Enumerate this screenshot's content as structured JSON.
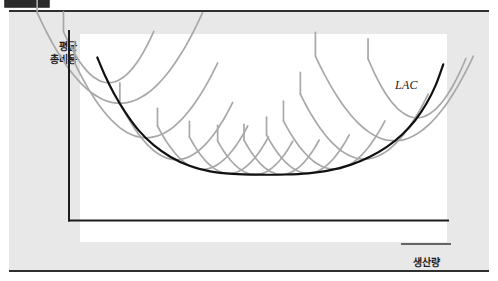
{
  "figure": {
    "kind": "economics-diagram",
    "background_color": "#e8e8e8",
    "plot_background_color": "#ffffff",
    "corner_tab_color": "#2b2b2b"
  },
  "axes": {
    "y_label_line1": "평균",
    "y_label_line2": "총비용",
    "x_label": "생산량",
    "axis_color": "#1c1c1c"
  },
  "annotations": {
    "lac_label": "LAC"
  },
  "chart_data": {
    "type": "line",
    "title": "",
    "subtitle": "",
    "xlabel": "생산량",
    "ylabel": "평균 총비용",
    "xlim": [
      0,
      100
    ],
    "ylim": [
      0,
      100
    ],
    "grid": false,
    "legend_position": "none",
    "axis_ticks": {
      "x": [],
      "y": []
    },
    "annotations": [
      {
        "text": "LAC",
        "x": 95,
        "y": 84,
        "style": "italic-serif",
        "describes": "long-run average cost envelope curve"
      }
    ],
    "series": [
      {
        "name": "LAC",
        "role": "envelope",
        "color": "#111111",
        "width": 2.2,
        "points": [
          [
            7.0,
            83.0
          ],
          [
            9.0,
            74.0
          ],
          [
            11.5,
            64.5
          ],
          [
            14.5,
            55.0
          ],
          [
            18.0,
            46.0
          ],
          [
            22.0,
            38.5
          ],
          [
            26.5,
            32.5
          ],
          [
            31.5,
            28.0
          ],
          [
            37.0,
            25.2
          ],
          [
            43.0,
            23.9
          ],
          [
            50.0,
            23.5
          ],
          [
            57.0,
            23.6
          ],
          [
            63.0,
            24.2
          ],
          [
            69.0,
            25.8
          ],
          [
            74.5,
            28.6
          ],
          [
            79.5,
            32.6
          ],
          [
            84.0,
            37.6
          ],
          [
            88.0,
            43.8
          ],
          [
            91.5,
            51.0
          ],
          [
            94.5,
            59.5
          ],
          [
            97.0,
            69.0
          ],
          [
            99.0,
            79.5
          ]
        ]
      },
      {
        "name": "SAC-1",
        "role": "short-run-average-cost",
        "color": "#a8a8a8",
        "width": 1.7,
        "tangent_x": 13.0,
        "half_width": 22.0,
        "depth": 46.0,
        "stem_up": 12.0
      },
      {
        "name": "SAC-2",
        "role": "short-run-average-cost",
        "color": "#a8a8a8",
        "width": 1.7,
        "tangent_x": 20.0,
        "half_width": 19.0,
        "depth": 38.0,
        "stem_up": 11.0
      },
      {
        "name": "SAC-3",
        "role": "short-run-average-cost",
        "color": "#a8a8a8",
        "width": 1.7,
        "tangent_x": 28.0,
        "half_width": 15.0,
        "depth": 29.0,
        "stem_up": 10.0
      },
      {
        "name": "SAC-4",
        "role": "short-run-average-cost",
        "color": "#a8a8a8",
        "width": 1.7,
        "tangent_x": 35.0,
        "half_width": 12.0,
        "depth": 22.0,
        "stem_up": 9.0
      },
      {
        "name": "SAC-5",
        "role": "short-run-average-cost",
        "color": "#a8a8a8",
        "width": 1.7,
        "tangent_x": 42.0,
        "half_width": 10.5,
        "depth": 18.5,
        "stem_up": 8.0
      },
      {
        "name": "SAC-6",
        "role": "short-run-average-cost",
        "color": "#a8a8a8",
        "width": 1.7,
        "tangent_x": 49.0,
        "half_width": 10.0,
        "depth": 17.0,
        "stem_up": 8.0
      },
      {
        "name": "SAC-7",
        "role": "short-run-average-cost",
        "color": "#a8a8a8",
        "width": 1.7,
        "tangent_x": 56.0,
        "half_width": 10.0,
        "depth": 17.5,
        "stem_up": 8.0
      },
      {
        "name": "SAC-8",
        "role": "short-run-average-cost",
        "color": "#a8a8a8",
        "width": 1.7,
        "tangent_x": 63.0,
        "half_width": 11.0,
        "depth": 19.5,
        "stem_up": 9.0
      },
      {
        "name": "SAC-9",
        "role": "short-run-average-cost",
        "color": "#a8a8a8",
        "width": 1.7,
        "tangent_x": 70.0,
        "half_width": 13.5,
        "depth": 24.5,
        "stem_up": 10.0
      },
      {
        "name": "SAC-10",
        "role": "short-run-average-cost",
        "color": "#a8a8a8",
        "width": 1.7,
        "tangent_x": 78.0,
        "half_width": 17.0,
        "depth": 33.0,
        "stem_up": 11.0
      },
      {
        "name": "SAC-11",
        "role": "short-run-average-cost",
        "color": "#a8a8a8",
        "width": 1.7,
        "tangent_x": 86.0,
        "half_width": 21.0,
        "depth": 43.0,
        "stem_up": 12.0
      },
      {
        "name": "SAC-12",
        "role": "short-run-average-cost",
        "color": "#a8a8a8",
        "width": 1.7,
        "tangent_x": 92.0,
        "half_width": 13.0,
        "depth": 30.0,
        "stem_up": 10.0
      },
      {
        "name": "SAC-0",
        "role": "short-run-average-cost",
        "color": "#a8a8a8",
        "width": 1.7,
        "tangent_x": 10.0,
        "half_width": 12.0,
        "depth": 26.0,
        "stem_up": 10.0
      }
    ]
  }
}
